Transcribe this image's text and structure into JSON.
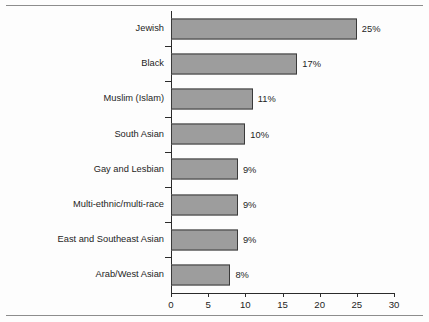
{
  "chart_data": {
    "type": "bar",
    "orientation": "horizontal",
    "title": "",
    "xlabel": "",
    "ylabel": "",
    "xlim": [
      0,
      30
    ],
    "xticks": [
      0,
      5,
      10,
      15,
      20,
      25,
      30
    ],
    "xticklabels": [
      "0",
      "5",
      "10",
      "15",
      "20",
      "25",
      "30"
    ],
    "grid": false,
    "legend": false,
    "categories": [
      "Jewish",
      "Black",
      "Muslim (Islam)",
      "South Asian",
      "Gay and Lesbian",
      "Multi-ethnic/multi-race",
      "East and Southeast Asian",
      "Arab/West Asian"
    ],
    "values": [
      25,
      17,
      11,
      10,
      9,
      9,
      9,
      8
    ],
    "data_labels": [
      "25%",
      "17%",
      "11%",
      "10%",
      "9%",
      "9%",
      "9%",
      "8%"
    ],
    "bar_fill_color": "#9d9d9d",
    "bar_border_color": "#3a3a3a",
    "axis_color": "#2b2b2b",
    "text_color": "#1e1e1e"
  }
}
